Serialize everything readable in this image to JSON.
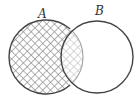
{
  "diagram": {
    "type": "venn",
    "sets": [
      {
        "id": "A",
        "label": "A",
        "cx": 46,
        "cy": 57,
        "r": 37,
        "shaded": true
      },
      {
        "id": "B",
        "label": "B",
        "cx": 97,
        "cy": 57,
        "r": 36,
        "shaded": false
      }
    ],
    "shaded_region": "A",
    "intersection_style": "lighter-hatch",
    "colors": {
      "outline": "#444444",
      "hatch": "#888888",
      "hatch_light": "#c4c4c4",
      "inner_arc": "#aaaaaa",
      "background": "#ffffff"
    }
  }
}
